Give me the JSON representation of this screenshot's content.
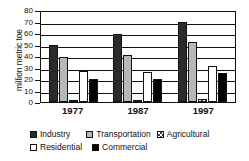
{
  "chart_data": {
    "type": "bar",
    "title": "",
    "xlabel": "",
    "ylabel": "million metric toe",
    "categories": [
      "1977",
      "1987",
      "1997"
    ],
    "ylim": [
      0,
      80
    ],
    "yticks": [
      0,
      10,
      20,
      30,
      40,
      50,
      60,
      70,
      80
    ],
    "grid": true,
    "legend_position": "bottom",
    "series": [
      {
        "name": "Industry",
        "color": "#2b2b2b",
        "values": [
          50,
          59,
          70
        ]
      },
      {
        "name": "Transportation",
        "color": "#b7b7b7",
        "values": [
          39,
          41,
          52
        ]
      },
      {
        "name": "Agricultural",
        "color": "#ffffff",
        "values": [
          1,
          2,
          3
        ]
      },
      {
        "name": "Residential",
        "color": "#ffffff",
        "values": [
          27,
          26,
          31
        ]
      },
      {
        "name": "Commercial",
        "color": "#000000",
        "values": [
          20,
          20,
          25
        ]
      }
    ]
  },
  "axis": {
    "y_title": "million metric toe",
    "y_tick_labels": [
      "80",
      "70",
      "60",
      "50",
      "40",
      "30",
      "20",
      "10",
      "0"
    ],
    "x_tick_labels": [
      "1977",
      "1987",
      "1997"
    ]
  },
  "legend": {
    "row1": [
      {
        "label": "Industry",
        "swatch": "industry-swatch"
      },
      {
        "label": "Transportation",
        "swatch": "transportation-swatch"
      },
      {
        "label": "Agricultural",
        "swatch": "agricultural-swatch"
      }
    ],
    "row2": [
      {
        "label": "Residential",
        "swatch": "residential-swatch"
      },
      {
        "label": "Commercial",
        "swatch": "commercial-swatch"
      }
    ]
  }
}
